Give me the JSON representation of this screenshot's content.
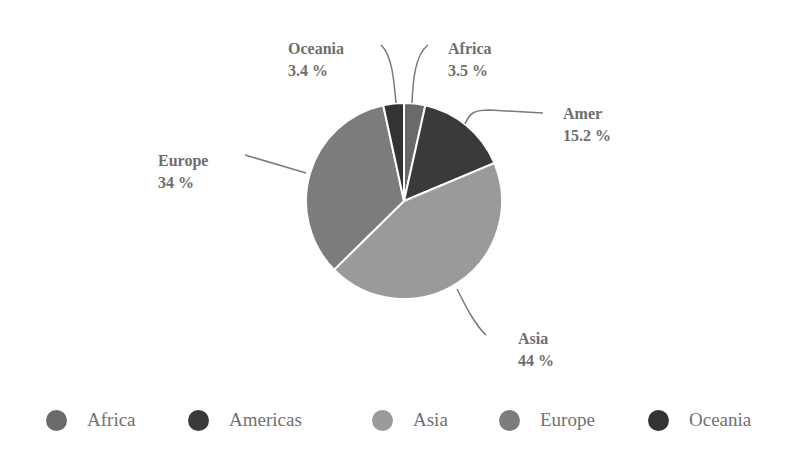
{
  "chart_data": {
    "type": "pie",
    "title": "",
    "categories": [
      "Africa",
      "Americas",
      "Asia",
      "Europe",
      "Oceania"
    ],
    "values": [
      3.5,
      15.2,
      44,
      34,
      3.4
    ],
    "value_labels": [
      "3.5 %",
      "15.2 %",
      "44 %",
      "34 %",
      "3.4 %"
    ],
    "colors": [
      "#6a6a6a",
      "#3a3a3a",
      "#9a9a9a",
      "#7c7c7c",
      "#333333"
    ],
    "legend_position": "bottom",
    "start_angle_deg": 0,
    "direction": "clockwise"
  },
  "labels": {
    "oceania": {
      "name": "Oceania",
      "value": "3.4 %"
    },
    "africa": {
      "name": "Africa",
      "value": "3.5 %"
    },
    "americas": {
      "name": "Americas",
      "value": "15.2 %"
    },
    "europe": {
      "name": "Europe",
      "value": "34 %"
    },
    "asia": {
      "name": "Asia",
      "value": "44 %"
    }
  },
  "legend": {
    "items": [
      {
        "label": "Africa",
        "color": "#6a6a6a"
      },
      {
        "label": "Americas",
        "color": "#3a3a3a"
      },
      {
        "label": "Asia",
        "color": "#9a9a9a"
      },
      {
        "label": "Europe",
        "color": "#7c7c7c"
      },
      {
        "label": "Oceania",
        "color": "#333333"
      }
    ]
  }
}
